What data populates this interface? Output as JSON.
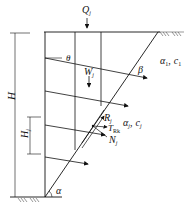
{
  "figure": {
    "labels": {
      "Q": "Q",
      "Q_sub": "j",
      "W": "W",
      "W_sub": "j",
      "theta": "θ",
      "beta": "β",
      "alpha": "α",
      "R": "R",
      "R_sub": "j",
      "T": "T",
      "T_sub": "Rk",
      "N": "N",
      "N_sub": "j",
      "H": "H",
      "H1": "H",
      "H1_sub": "j",
      "soil1": "α",
      "soil1_sub": "1",
      "soil1_sep": ",",
      "soil1_c": "c",
      "soil1_c_sub": "1",
      "soil2": "α",
      "soil2_sub": "j",
      "soil2_sep": ",",
      "soil2_c": "c",
      "soil2_c_sub": "j"
    },
    "colors": {
      "line": "#111111",
      "background": "#ffffff"
    }
  }
}
